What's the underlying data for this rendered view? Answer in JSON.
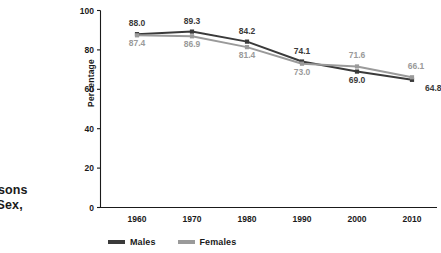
{
  "caption": {
    "line1": "ersons",
    "line2": "y Sex,"
  },
  "legend": {
    "males_label": "Males",
    "females_label": "Females"
  },
  "colors": {
    "males": "#3a3a3a",
    "females": "#9a9a9a",
    "axis": "#1a1a1a",
    "background": "#ffffff"
  },
  "chart_data": {
    "type": "line",
    "title": "",
    "xlabel": "",
    "ylabel": "Percentage",
    "categories": [
      "1960",
      "1970",
      "1980",
      "1990",
      "2000",
      "2010"
    ],
    "x": [
      1960,
      1970,
      1980,
      1990,
      2000,
      2010
    ],
    "ylim": [
      0,
      100
    ],
    "yticks": [
      0,
      20,
      40,
      60,
      80,
      100
    ],
    "ytick_labels": [
      "0",
      "20",
      "40",
      "60",
      "80",
      "100"
    ],
    "grid": false,
    "legend_position": "bottom",
    "marker": "square",
    "series": [
      {
        "name": "Males",
        "color": "#3a3a3a",
        "values": [
          88.0,
          89.3,
          84.2,
          74.1,
          69.0,
          64.8
        ],
        "labels": [
          "88.0",
          "89.3",
          "84.2",
          "74.1",
          "69.0",
          "64.8"
        ]
      },
      {
        "name": "Females",
        "color": "#9a9a9a",
        "values": [
          87.4,
          86.9,
          81.4,
          73.0,
          71.6,
          66.1
        ],
        "labels": [
          "87.4",
          "86.9",
          "81.4",
          "73.0",
          "71.6",
          "66.1"
        ]
      }
    ]
  }
}
